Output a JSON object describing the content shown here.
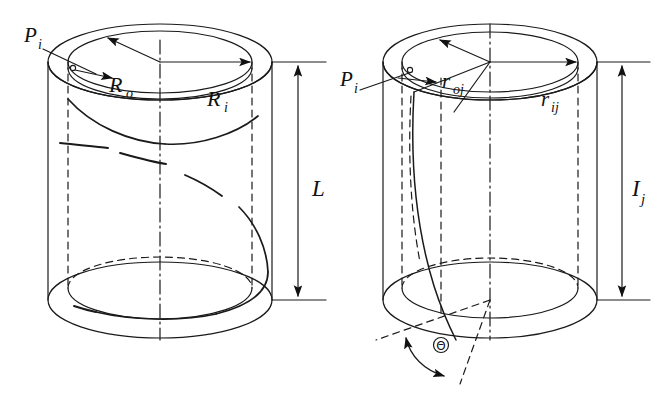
{
  "figure": {
    "background_color": "#ffffff",
    "stroke_color": "#1a1a1a",
    "line_width_px": 1.2
  },
  "panels": [
    {
      "id": "left-cylinder",
      "name": "left-cylinder-panel",
      "description": "Hollow cylinder with full helical winding, radii R_o and R_i, axial length L",
      "labels": [
        {
          "name": "point-label-pi",
          "base": "P",
          "sub": "i",
          "x": 33,
          "y": 42
        },
        {
          "name": "radius-label-ro",
          "base": "R",
          "sub": "o",
          "x": 118,
          "y": 85
        },
        {
          "name": "radius-label-ri",
          "base": "R",
          "sub": "i",
          "x": 216,
          "y": 99
        },
        {
          "name": "length-label-l",
          "base": "L",
          "sub": "",
          "x": 315,
          "y": 196
        }
      ]
    },
    {
      "id": "right-cylinder",
      "name": "right-cylinder-panel",
      "description": "Hollow cylinder with steep helical segment, radii r_oj and r_ij, axial length I_j, helix angle Theta",
      "labels": [
        {
          "name": "point-label-pi",
          "base": "P",
          "sub": "i",
          "x": 349,
          "y": 85
        },
        {
          "name": "radius-label-roj",
          "base": "r",
          "sub": "oj",
          "x": 447,
          "y": 82
        },
        {
          "name": "radius-label-rij",
          "base": "r",
          "sub": "ij",
          "x": 548,
          "y": 100
        },
        {
          "name": "length-label-ij",
          "base": "I",
          "sub": "j",
          "x": 637,
          "y": 196
        },
        {
          "name": "angle-label-theta",
          "base": "Θ",
          "sub": "",
          "x": 441,
          "y": 350
        }
      ]
    }
  ],
  "symbols": {
    "P_i": "Pᵢ",
    "R_o": "Rₒ",
    "R_i": "Rᵢ",
    "L": "L",
    "r_oj": "rₒⱼ",
    "r_ij": "rᵢⱼ",
    "I_j": "Iⱼ",
    "Theta": "Θ"
  },
  "text": {
    "pi": "P",
    "pi_sub": "i",
    "ro": "R",
    "ro_sub": "o",
    "ri": "R",
    "ri_sub": "i",
    "l": "L",
    "roj": "r",
    "roj_sub": "oj",
    "rij": "r",
    "rij_sub": "ij",
    "ij": "I",
    "ij_sub": "j",
    "theta": "Θ"
  }
}
